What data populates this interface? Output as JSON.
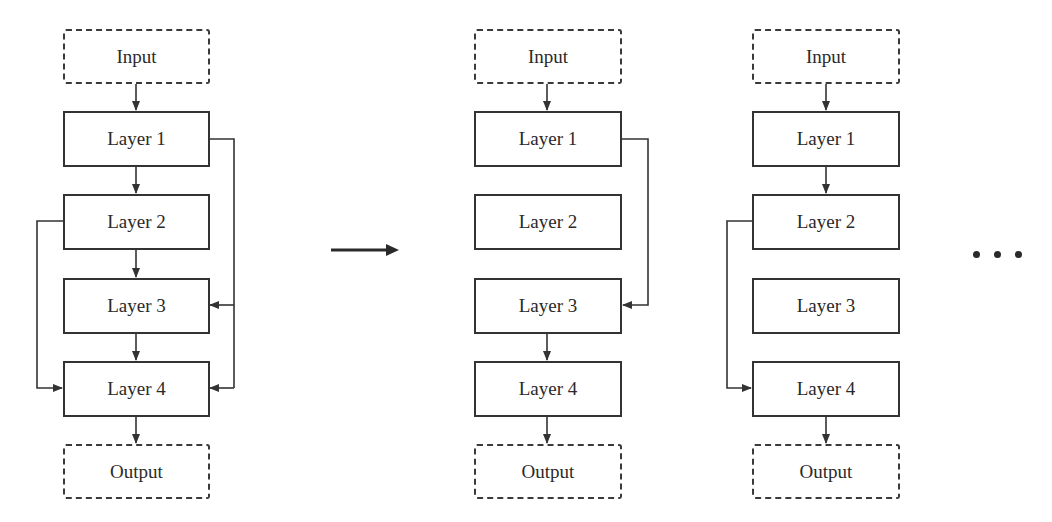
{
  "diagrams": [
    {
      "id": "full-network",
      "input_label": "Input",
      "layers": [
        "Layer 1",
        "Layer 2",
        "Layer 3",
        "Layer 4"
      ],
      "output_label": "Output",
      "connections": [
        {
          "from": "Input",
          "to": "Layer 1"
        },
        {
          "from": "Layer 1",
          "to": "Layer 2"
        },
        {
          "from": "Layer 2",
          "to": "Layer 3"
        },
        {
          "from": "Layer 3",
          "to": "Layer 4"
        },
        {
          "from": "Layer 4",
          "to": "Output"
        },
        {
          "from": "Layer 1",
          "to": "Layer 3",
          "type": "skip-right"
        },
        {
          "from": "Layer 1",
          "to": "Layer 4",
          "type": "skip-right"
        },
        {
          "from": "Layer 2",
          "to": "Layer 4",
          "type": "skip-left"
        }
      ]
    },
    {
      "id": "sampled-path-1",
      "input_label": "Input",
      "layers": [
        "Layer 1",
        "Layer 2",
        "Layer 3",
        "Layer 4"
      ],
      "output_label": "Output",
      "connections": [
        {
          "from": "Input",
          "to": "Layer 1"
        },
        {
          "from": "Layer 1",
          "to": "Layer 3",
          "type": "skip-right"
        },
        {
          "from": "Layer 3",
          "to": "Layer 4"
        },
        {
          "from": "Layer 4",
          "to": "Output"
        }
      ]
    },
    {
      "id": "sampled-path-2",
      "input_label": "Input",
      "layers": [
        "Layer 1",
        "Layer 2",
        "Layer 3",
        "Layer 4"
      ],
      "output_label": "Output",
      "connections": [
        {
          "from": "Input",
          "to": "Layer 1"
        },
        {
          "from": "Layer 1",
          "to": "Layer 2"
        },
        {
          "from": "Layer 2",
          "to": "Layer 4",
          "type": "skip-left"
        },
        {
          "from": "Layer 4",
          "to": "Output"
        }
      ]
    }
  ],
  "transition_arrow": "right-arrow",
  "continuation": "ellipsis",
  "colors": {
    "stroke": "#333333",
    "text": "#2a2a2a",
    "background": "#ffffff"
  }
}
